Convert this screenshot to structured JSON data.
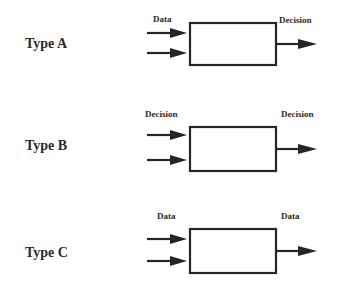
{
  "diagram": {
    "rows": [
      {
        "type_label": "Type A",
        "input_label": "Data",
        "output_label": "Decision"
      },
      {
        "type_label": "Type B",
        "input_label": "Decision",
        "output_label": "Decision"
      },
      {
        "type_label": "Type C",
        "input_label": "Data",
        "output_label": "Data"
      }
    ],
    "colors": {
      "stroke": "#262626",
      "text": "#2a2a2a",
      "background": "#ffffff"
    }
  }
}
